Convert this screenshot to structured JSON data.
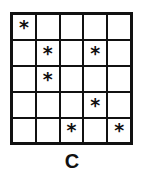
{
  "figure": {
    "caption": "C",
    "grid": {
      "rows": 5,
      "columns": 5,
      "marker": "*",
      "marker_name": "asterisk-icon",
      "line_color": "#111111",
      "cell_color": "#ffffff",
      "cells": [
        [
          "*",
          "",
          "",
          "",
          ""
        ],
        [
          "",
          "*",
          "",
          "*",
          ""
        ],
        [
          "",
          "*",
          "",
          "",
          ""
        ],
        [
          "",
          "",
          "",
          "*",
          ""
        ],
        [
          "",
          "",
          "*",
          "",
          "*"
        ]
      ],
      "marked_positions": [
        {
          "row": 1,
          "column": 1
        },
        {
          "row": 2,
          "column": 2
        },
        {
          "row": 2,
          "column": 4
        },
        {
          "row": 3,
          "column": 2
        },
        {
          "row": 4,
          "column": 4
        },
        {
          "row": 5,
          "column": 3
        },
        {
          "row": 5,
          "column": 5
        }
      ],
      "marked_count": 7
    }
  }
}
